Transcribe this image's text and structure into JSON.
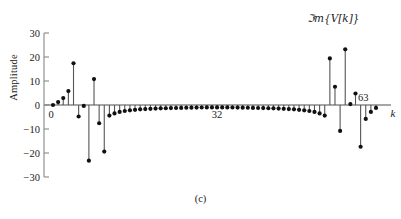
{
  "figure": {
    "caption": "(c)",
    "annotation": "ℑm{V[k]}"
  },
  "axes": {
    "ylabel": "Amplitude",
    "xlabel": "k",
    "ytick_labels": [
      "30",
      "20",
      "10",
      "0",
      "−10",
      "−20",
      "−30"
    ],
    "xtick_labels": [
      "0",
      "32",
      "63"
    ]
  },
  "colors": {
    "stem": "#555555",
    "marker": "#111111",
    "axis": "#888888",
    "text": "#1a1a1a"
  },
  "chart_data": {
    "type": "scatter",
    "title": "",
    "subtitle": "",
    "xlabel": "k",
    "ylabel": "Amplitude",
    "legend": [],
    "legend_position": "none",
    "grid": false,
    "annotations": [
      "ℑm{V[k]}",
      "0",
      "32",
      "63"
    ],
    "xlim": [
      0,
      63
    ],
    "ylim": [
      -30,
      30
    ],
    "yticks": [
      -30,
      -20,
      -10,
      0,
      10,
      20,
      30
    ],
    "xticks": [
      0,
      32,
      63
    ],
    "marker": "filled-circle",
    "stems": true,
    "baseline": 0,
    "series_name": "Im{V[k]}",
    "x": [
      0,
      1,
      2,
      3,
      4,
      5,
      6,
      7,
      8,
      9,
      10,
      11,
      12,
      13,
      14,
      15,
      16,
      17,
      18,
      19,
      20,
      21,
      22,
      23,
      24,
      25,
      26,
      27,
      28,
      29,
      30,
      31,
      32,
      33,
      34,
      35,
      36,
      37,
      38,
      39,
      40,
      41,
      42,
      43,
      44,
      45,
      46,
      47,
      48,
      49,
      50,
      51,
      52,
      53,
      54,
      55,
      56,
      57,
      58,
      59,
      60,
      61,
      62,
      63
    ],
    "values": [
      0,
      1.2,
      2.9,
      5.8,
      17.4,
      -4.8,
      -0.4,
      -23.2,
      10.8,
      -7.6,
      -19.4,
      -4.4,
      -3.5,
      -2.9,
      -2.5,
      -2.2,
      -2.0,
      -1.8,
      -1.7,
      -1.6,
      -1.5,
      -1.4,
      -1.35,
      -1.3,
      -1.25,
      -1.2,
      -1.15,
      -1.1,
      -1.08,
      -1.05,
      -1.02,
      -1.0,
      -1.0,
      -1.0,
      -1.02,
      -1.05,
      -1.08,
      -1.1,
      -1.15,
      -1.2,
      -1.25,
      -1.3,
      -1.35,
      -1.4,
      -1.5,
      -1.6,
      -1.7,
      -1.8,
      -2.0,
      -2.2,
      -2.5,
      -2.9,
      -3.5,
      -4.4,
      19.4,
      7.6,
      -10.8,
      23.2,
      0.4,
      4.8,
      -17.4,
      -5.8,
      -2.9,
      -1.2
    ]
  }
}
